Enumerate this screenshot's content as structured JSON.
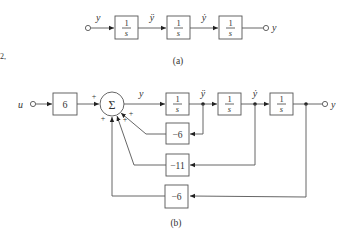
{
  "diagram_a": {
    "caption": "(a)",
    "input_signal": "y⃛",
    "signals": [
      "y⃛",
      "ÿ",
      "ẏ"
    ],
    "output_label": "y",
    "blocks": [
      {
        "num": "1",
        "den": "s"
      },
      {
        "num": "1",
        "den": "s"
      },
      {
        "num": "1",
        "den": "s"
      }
    ]
  },
  "diagram_b": {
    "caption": "(b)",
    "input_label": "u",
    "input_gain": "6",
    "summer_symbol": "Σ",
    "summer_signs": [
      "+",
      "+",
      "+",
      "+"
    ],
    "forward_signals": [
      "y⃛",
      "ÿ",
      "ẏ"
    ],
    "output_label": "y",
    "integrators": [
      {
        "num": "1",
        "den": "s"
      },
      {
        "num": "1",
        "den": "s"
      },
      {
        "num": "1",
        "den": "s"
      }
    ],
    "feedback_gains": [
      "−6",
      "−11",
      "−6"
    ]
  },
  "margin_mark": "2,"
}
